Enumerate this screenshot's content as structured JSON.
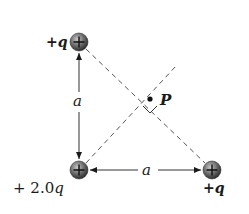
{
  "diagram": {
    "charges": [
      {
        "id": "top-left",
        "label_sign": "+",
        "label_var": "q",
        "symbol": "+",
        "cx": 79,
        "cy": 42
      },
      {
        "id": "bottom-left",
        "label_sign": "+ 2.0",
        "label_var": "q",
        "symbol": "+",
        "cx": 79,
        "cy": 170
      },
      {
        "id": "bottom-right",
        "label_sign": "+",
        "label_var": "q",
        "symbol": "+",
        "cx": 212,
        "cy": 170
      }
    ],
    "point": {
      "label": "P",
      "cx": 150,
      "cy": 99
    },
    "dimensions": {
      "vertical_label": "a",
      "horizontal_label": "a"
    },
    "colors": {
      "charge_fill": "#6e6e6e",
      "line": "#333333",
      "dash": "#555555"
    }
  }
}
